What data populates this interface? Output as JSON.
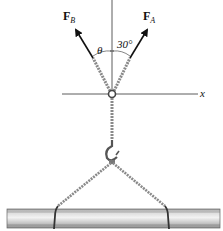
{
  "figure": {
    "forces": [
      {
        "symbol": "F",
        "subscript": "B",
        "direction": "up-left",
        "angle_label": "θ"
      },
      {
        "symbol": "F",
        "subscript": "A",
        "direction": "up-right",
        "angle_label": "30°"
      }
    ],
    "axis_label": "x",
    "angle_theta": "θ",
    "angle_30": "30°",
    "components": [
      "ring",
      "chain",
      "hook",
      "beam"
    ],
    "colors": {
      "line": "#111111",
      "chain": "#8a8a8a",
      "beam_light": "#e6e6e6",
      "beam_dark": "#9a9a9a"
    }
  }
}
